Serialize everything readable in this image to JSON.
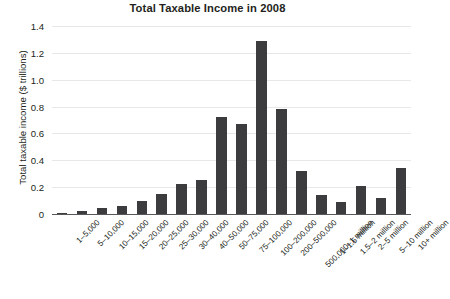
{
  "chart_data": {
    "type": "bar",
    "title": "Total Taxable Income in 2008",
    "xlabel": "",
    "ylabel": "Total taxable income ($ trillions)",
    "categories": [
      "1–5,000",
      "5–10,000",
      "10–15,000",
      "15–20,000",
      "20–25,000",
      "25–30,000",
      "30–40,000",
      "40–50,000",
      "50–75,000",
      "75–100,000",
      "100–200,000",
      "200–500,000",
      "500,000–1 million",
      "1–1.5 million",
      "1.5–2 million",
      "2–5 million",
      "5–10 million",
      "10+ million"
    ],
    "values": [
      0.005,
      0.025,
      0.045,
      0.06,
      0.1,
      0.15,
      0.22,
      0.25,
      0.72,
      0.67,
      1.29,
      0.78,
      0.32,
      0.14,
      0.09,
      0.21,
      0.12,
      0.34
    ],
    "ylim": [
      0,
      1.4
    ],
    "yticks": [
      "0",
      "0.2",
      "0.4",
      "0.6",
      "0.8",
      "1.0",
      "1.2",
      "1.4"
    ],
    "ytick_values": [
      0,
      0.2,
      0.4,
      0.6,
      0.8,
      1.0,
      1.2,
      1.4
    ],
    "grid": true,
    "legend": null,
    "bar_color": "#3c3c3e",
    "grid_color": "#e8e8e8",
    "axis_color": "#58585a",
    "background_color": "#ffffff"
  }
}
